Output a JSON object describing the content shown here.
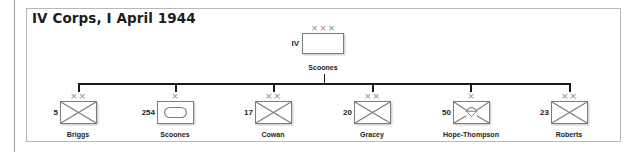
{
  "title": "IV Corps, I April 1944",
  "colors": {
    "frame_border": "#b8b8b8",
    "box_border": "#7d7d7d",
    "connector": "#1a1a1a",
    "echelon_marks": "#8a8a8a",
    "text": "#222222"
  },
  "hq": {
    "designation": "IV",
    "echelon": "×××",
    "echelon_level": "corps",
    "symbol": "plain",
    "commander": "Scoones"
  },
  "subordinates": [
    {
      "designation": "5",
      "echelon": "××",
      "echelon_level": "division",
      "symbol": "infantry",
      "commander": "Briggs"
    },
    {
      "designation": "254",
      "echelon": "×",
      "echelon_level": "brigade",
      "symbol": "armour",
      "commander": "Scoones"
    },
    {
      "designation": "17",
      "echelon": "××",
      "echelon_level": "division",
      "symbol": "infantry",
      "commander": "Cowan"
    },
    {
      "designation": "20",
      "echelon": "××",
      "echelon_level": "division",
      "symbol": "infantry",
      "commander": "Gracey"
    },
    {
      "designation": "50",
      "echelon": "×",
      "echelon_level": "brigade",
      "symbol": "parachute",
      "commander": "Hope-Thompson"
    },
    {
      "designation": "23",
      "echelon": "××",
      "echelon_level": "division",
      "symbol": "infantry",
      "commander": "Roberts"
    }
  ]
}
